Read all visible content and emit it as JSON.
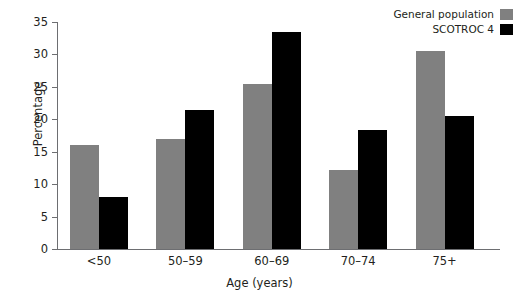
{
  "chart_data": {
    "type": "bar",
    "title": "",
    "subtitle": "",
    "xlabel": "Age (years)",
    "ylabel": "Percentage",
    "categories": [
      "<50",
      "50–59",
      "60–69",
      "70–74",
      "75+"
    ],
    "series": [
      {
        "name": "General population",
        "color": "#808080",
        "values": [
          16.1,
          17.0,
          25.5,
          12.2,
          30.6
        ]
      },
      {
        "name": "SCOTROC 4",
        "color": "#000000",
        "values": [
          8.0,
          21.4,
          33.5,
          18.3,
          20.5
        ]
      }
    ],
    "ylim": [
      0,
      35
    ],
    "ytick_labels": [
      "0",
      "5",
      "10",
      "15",
      "20",
      "25",
      "30",
      "35"
    ],
    "ytick_values": [
      0,
      5,
      10,
      15,
      20,
      25,
      30,
      35
    ],
    "grid": false,
    "legend_position": "top-right",
    "axis_color": "#6d6e71",
    "text_color": "#231f20",
    "background": "#ffffff"
  }
}
